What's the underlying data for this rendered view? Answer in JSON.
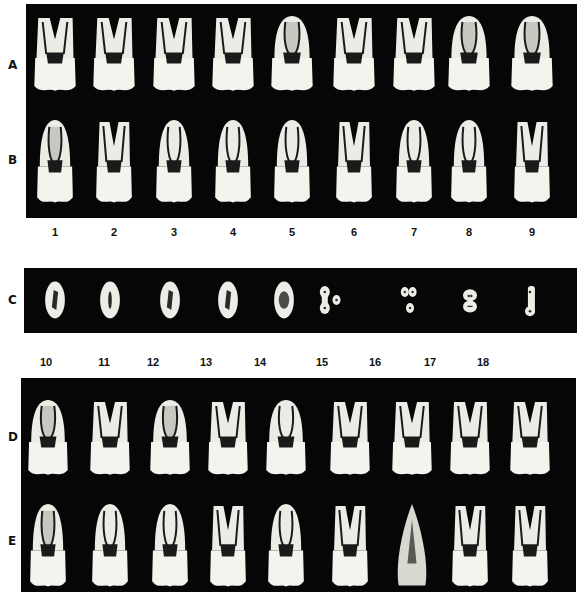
{
  "figure": {
    "rows": [
      {
        "id": "A",
        "label": "A",
        "kind": "longitudinal-section-buccolingual",
        "count": 9
      },
      {
        "id": "B",
        "label": "B",
        "kind": "longitudinal-section-mesiodistal",
        "count": 9
      },
      {
        "id": "C",
        "label": "C",
        "kind": "cross-section",
        "count": 9
      },
      {
        "id": "D",
        "label": "D",
        "kind": "longitudinal-section-buccolingual",
        "count": 9
      },
      {
        "id": "E",
        "label": "E",
        "kind": "longitudinal-section-mesiodistal",
        "count": 9
      }
    ],
    "top_numbers": [
      "1",
      "2",
      "3",
      "4",
      "5",
      "6",
      "7",
      "8",
      "9"
    ],
    "bottom_numbers": [
      "10",
      "11",
      "12",
      "13",
      "14",
      "15",
      "16",
      "17",
      "18"
    ],
    "specimens": {
      "A": [
        "two-root-pulp",
        "v-roots",
        "two-root-pulp",
        "two-root-pulp",
        "single-canal-wide",
        "v-roots",
        "v-roots",
        "single-canal-wide",
        "single-canal-wide"
      ],
      "B": [
        "single-canal-wide",
        "tall-bent",
        "single-canal",
        "single-canal",
        "single-canal",
        "split-roots",
        "single-canal",
        "single-canal",
        "split-roots"
      ],
      "C": [
        "oval-canal",
        "oval-slit",
        "oval-canal",
        "oval-canal",
        "oval-round",
        "twin-lobes",
        "triple-lobes",
        "figure-eight",
        "bar-lobes"
      ],
      "D": [
        "single-canal-wide",
        "v-roots",
        "single-canal-wide",
        "two-root-pulp",
        "curved-root",
        "v-roots",
        "v-roots",
        "v-roots",
        "v-roots"
      ],
      "E": [
        "single-canal-wide",
        "single-canal",
        "single-canal",
        "two-root-pulp",
        "single-canal",
        "split-roots",
        "cone",
        "v-roots",
        "split-roots"
      ]
    }
  }
}
